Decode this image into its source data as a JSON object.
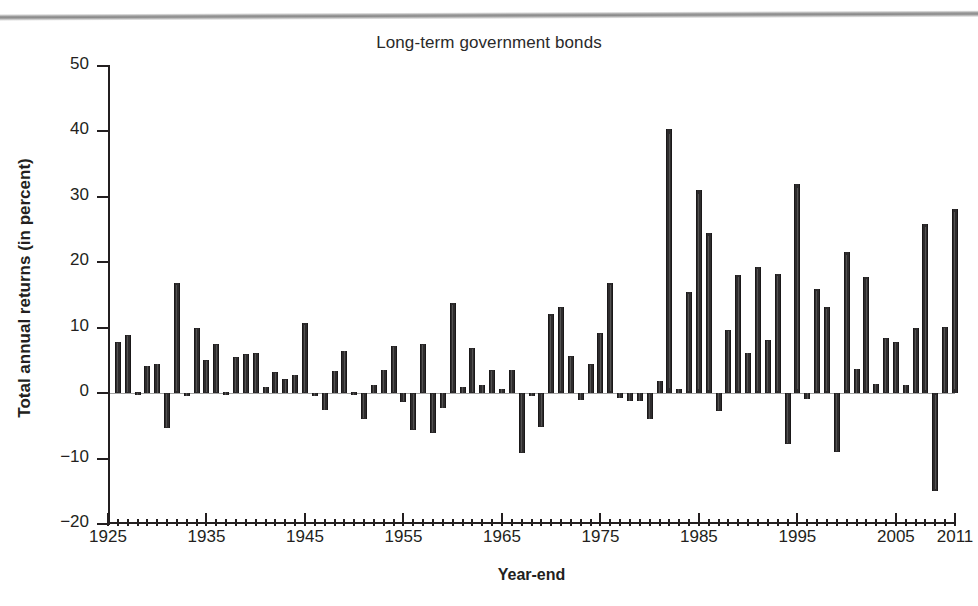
{
  "figure": {
    "title": "Long-term government bonds",
    "ylabel": "Total annual returns (in percent)",
    "xlabel": "Year-end"
  },
  "chart_data": {
    "type": "bar",
    "title": "Long-term government bonds",
    "xlabel": "Year-end",
    "ylabel": "Total annual returns (in percent)",
    "ylim": [
      -20,
      50
    ],
    "xlim": [
      1925,
      2011
    ],
    "ytick_labels": [
      "50",
      "40",
      "30",
      "20",
      "10",
      "0",
      "-10",
      "-20"
    ],
    "yticks": [
      50,
      40,
      30,
      20,
      10,
      0,
      -10,
      -20
    ],
    "xtick_labels": [
      "1925",
      "1935",
      "1945",
      "1955",
      "1965",
      "1975",
      "1985",
      "1995",
      "2005",
      "2011"
    ],
    "xticks": [
      1925,
      1935,
      1945,
      1955,
      1965,
      1975,
      1985,
      1995,
      2005,
      2011
    ],
    "xtick_minor_step": 1,
    "grid": false,
    "legend": null,
    "bar_color": "#2e2c2d",
    "categories": [
      1926,
      1927,
      1928,
      1929,
      1930,
      1931,
      1932,
      1933,
      1934,
      1935,
      1936,
      1937,
      1938,
      1939,
      1940,
      1941,
      1942,
      1943,
      1944,
      1945,
      1946,
      1947,
      1948,
      1949,
      1950,
      1951,
      1952,
      1953,
      1954,
      1955,
      1956,
      1957,
      1958,
      1959,
      1960,
      1961,
      1962,
      1963,
      1964,
      1965,
      1966,
      1967,
      1968,
      1969,
      1970,
      1971,
      1972,
      1973,
      1974,
      1975,
      1976,
      1977,
      1978,
      1979,
      1980,
      1981,
      1982,
      1983,
      1984,
      1985,
      1986,
      1987,
      1988,
      1989,
      1990,
      1991,
      1992,
      1993,
      1994,
      1995,
      1996,
      1997,
      1998,
      1999,
      2000,
      2001,
      2002,
      2003,
      2004,
      2005,
      2006,
      2007,
      2008,
      2009,
      2010,
      2011
    ],
    "values": [
      7.8,
      8.9,
      0.1,
      4.2,
      4.5,
      -5.3,
      16.8,
      -0.1,
      10.0,
      5.0,
      7.5,
      0.2,
      5.5,
      6.0,
      6.1,
      0.9,
      3.2,
      2.1,
      2.8,
      10.7,
      -0.1,
      -2.6,
      3.4,
      6.5,
      0.1,
      -3.9,
      1.2,
      3.6,
      7.2,
      -1.3,
      -5.6,
      7.5,
      -6.1,
      -2.3,
      13.8,
      1.0,
      6.9,
      1.2,
      3.5,
      0.7,
      3.6,
      -9.2,
      -0.3,
      -5.1,
      12.1,
      13.2,
      5.7,
      -1.1,
      4.4,
      9.2,
      16.8,
      -0.7,
      -1.2,
      -1.2,
      -4.0,
      1.9,
      40.4,
      0.7,
      15.5,
      31.0,
      24.5,
      -2.7,
      9.7,
      18.1,
      6.2,
      19.3,
      8.1,
      18.2,
      -7.8,
      32.0,
      -0.9,
      15.9,
      13.1,
      -9.0,
      21.5,
      3.7,
      17.8,
      1.4,
      8.5,
      7.8,
      1.2,
      9.9,
      25.9,
      -14.9,
      10.1,
      28.2
    ]
  }
}
